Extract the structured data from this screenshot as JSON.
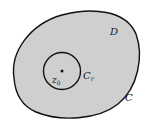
{
  "diagram": {
    "type": "complex-analysis-contour",
    "colors": {
      "background": "#ffffff",
      "region_fill": "#cfcfcf",
      "stroke": "#111111"
    },
    "labels": {
      "region": "D",
      "outer_contour": "C",
      "inner_contour_main": "C",
      "inner_contour_sub": "r",
      "point_main": "z",
      "point_sub": "0"
    }
  }
}
